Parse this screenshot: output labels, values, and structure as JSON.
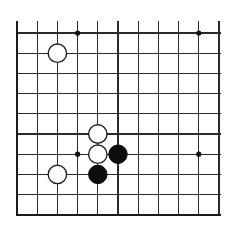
{
  "figure": {
    "kind": "go-board-diagram",
    "title": "",
    "background_color": "#ffffff"
  },
  "board": {
    "label": "Go board grid",
    "origin_x": 17,
    "origin_y": 33,
    "spacing": 20.2,
    "columns": 11,
    "rows": 10,
    "line_color": "#2b2b2b",
    "edge_color": "#1a1a1a",
    "line_width": 1.1,
    "edge_width": 2.4,
    "thick_edges": [
      "left",
      "bottom"
    ],
    "clip_right": 220,
    "clip_top": 33
  },
  "star_points": {
    "label": "hoshi",
    "radius": 2.6,
    "color": "#111111",
    "points": [
      {
        "col": 3,
        "row": 0
      },
      {
        "col": 9,
        "row": 0
      },
      {
        "col": 3,
        "row": 6
      },
      {
        "col": 9,
        "row": 6
      }
    ]
  },
  "stones": {
    "radius": 9.2,
    "black_color": "#0d0d0d",
    "white_color": "#ffffff",
    "white_outline": "#222222",
    "items": [
      {
        "color": "white",
        "col": 2,
        "row": 1,
        "name": "stone-white-c2r1"
      },
      {
        "color": "white",
        "col": 4,
        "row": 5,
        "name": "stone-white-c4r5"
      },
      {
        "color": "white",
        "col": 4,
        "row": 6,
        "name": "stone-white-c4r6"
      },
      {
        "color": "black",
        "col": 5,
        "row": 6,
        "name": "stone-black-c5r6"
      },
      {
        "color": "white",
        "col": 2,
        "row": 7,
        "name": "stone-white-c2r7"
      },
      {
        "color": "black",
        "col": 4,
        "row": 7,
        "name": "stone-black-c4r7"
      }
    ]
  }
}
